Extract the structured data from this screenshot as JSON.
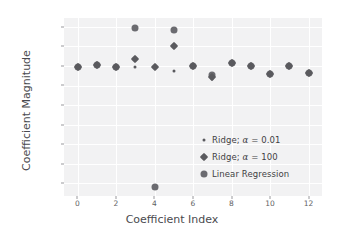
{
  "chart_data": {
    "type": "scatter",
    "title": "",
    "xlabel": "Coefficient Index",
    "ylabel": "Coefficient Magnitude",
    "xlim": [
      -0.7,
      12.7
    ],
    "ylim": [
      -13.3,
      4.9
    ],
    "xticks": [
      "0",
      "2",
      "4",
      "6",
      "8",
      "10",
      "12"
    ],
    "xtick_values": [
      0,
      2,
      4,
      6,
      8,
      10,
      12
    ],
    "yticks": [
      "4",
      "2",
      "0",
      "−2",
      "−4",
      "−6",
      "−8",
      "−10",
      "−12"
    ],
    "ytick_values": [
      4,
      2,
      0,
      -2,
      -4,
      -6,
      -8,
      -10,
      -12
    ],
    "grid": true,
    "legend_position": "lower right",
    "x": [
      0,
      1,
      2,
      3,
      4,
      5,
      6,
      7,
      8,
      9,
      10,
      11,
      12
    ],
    "series": [
      {
        "name": "Ridge; α = 0.01",
        "marker": "small-dot",
        "color": "#5a5a5e",
        "values": [
          -0.12,
          0.05,
          -0.1,
          -0.12,
          -0.12,
          -0.55,
          -0.02,
          -1.3,
          0.3,
          -0.02,
          -0.8,
          0.0,
          -0.7
        ]
      },
      {
        "name": "Ridge; α = 100",
        "marker": "diamond",
        "color": "#5a5a5e",
        "values": [
          -0.12,
          0.05,
          -0.1,
          0.72,
          -0.12,
          2.0,
          -0.02,
          -1.1,
          0.3,
          -0.02,
          -0.8,
          0.0,
          -0.7
        ]
      },
      {
        "name": "Linear Regression",
        "marker": "circle",
        "color": "#6b6b70",
        "values": [
          -0.12,
          0.05,
          -0.1,
          3.88,
          -12.4,
          3.72,
          -0.02,
          -0.95,
          0.3,
          -0.02,
          -0.8,
          0.0,
          -0.7
        ]
      }
    ]
  },
  "legend": {
    "items": [
      {
        "label_prefix": "Ridge; ",
        "alpha": "α",
        "label_suffix": " = 0.01",
        "full": "Ridge; α = 0.01"
      },
      {
        "label_prefix": "Ridge; ",
        "alpha": "α",
        "label_suffix": " = 100",
        "full": "Ridge; α = 100"
      },
      {
        "label_prefix": "",
        "alpha": "",
        "label_suffix": "Linear Regression",
        "full": "Linear Regression"
      }
    ]
  },
  "style": {
    "plot_background": "#f2f2f3",
    "figure_background": "#ffffff",
    "grid_color": "#ffffff",
    "tick_color": "#5f5f63",
    "label_color": "#4a4a4e"
  }
}
